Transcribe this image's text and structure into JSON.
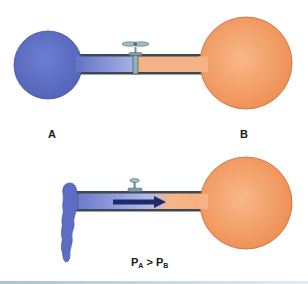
{
  "diagram": {
    "top_panel": {
      "state": "valve-closed",
      "container_a": {
        "label": "A",
        "gas": "blue",
        "color": "#5f6fc4"
      },
      "container_b": {
        "label": "B",
        "gas": "orange",
        "color": "#f4a06a"
      },
      "valve_icon": "valve-handle-icon"
    },
    "bottom_panel": {
      "state": "valve-open",
      "flow_direction": "A-to-B",
      "arrow_icon": "right-arrow-icon",
      "equation": {
        "p1": "P",
        "sub1": "A",
        "op": " > ",
        "p2": "P",
        "sub2": "B"
      }
    },
    "colors": {
      "gas_a": "#5f6fc4",
      "gas_a_light": "#a8b1e3",
      "gas_b": "#f4a06a",
      "gas_b_dark": "#ec8a4e",
      "tube_wall": "#3b4a52",
      "valve": "#7fa1a6",
      "arrow": "#1d2a6b"
    }
  }
}
